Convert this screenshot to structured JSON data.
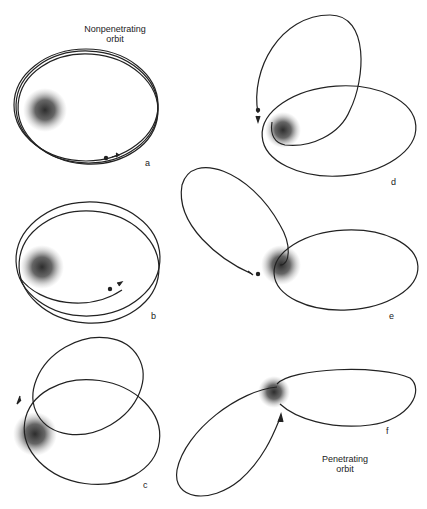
{
  "figure": {
    "title_top": {
      "line1": "Nonpenetrating",
      "line2": "orbit"
    },
    "title_bottom": {
      "line1": "Penetrating",
      "line2": "orbit"
    },
    "panels": [
      {
        "letter": "a",
        "description": "nonpenetrating orbit, nearly closed ellipse, slow precession"
      },
      {
        "letter": "b",
        "description": "nonpenetrating orbit, slightly precessing ellipse"
      },
      {
        "letter": "c",
        "description": "orbit with moderate precession"
      },
      {
        "letter": "d",
        "description": "orbit with strong precession (rosette)"
      },
      {
        "letter": "e",
        "description": "orbit with strong precession passing core"
      },
      {
        "letter": "f",
        "description": "penetrating orbit through core"
      }
    ],
    "colors": {
      "line": "#222222",
      "core": "#333333",
      "background": "#ffffff"
    }
  }
}
